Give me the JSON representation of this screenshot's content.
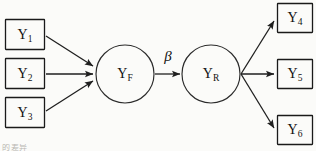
{
  "diagram": {
    "type": "path-diagram",
    "background_color": "#fbfbf9",
    "line_color": "#1f1f1f",
    "indicator_nodes_left": [
      {
        "id": "Y1",
        "base": "Y",
        "subscript": "1",
        "shape": "rectangle",
        "x": 5,
        "y": 19,
        "w": 40,
        "h": 31
      },
      {
        "id": "Y2",
        "base": "Y",
        "subscript": "2",
        "shape": "rectangle",
        "x": 5,
        "y": 58,
        "w": 40,
        "h": 31
      },
      {
        "id": "Y3",
        "base": "Y",
        "subscript": "3",
        "shape": "rectangle",
        "x": 5,
        "y": 97,
        "w": 40,
        "h": 31
      }
    ],
    "latent_nodes": [
      {
        "id": "YF",
        "base": "Y",
        "subscript": "F",
        "shape": "circle",
        "cx": 125,
        "cy": 74,
        "r": 29
      },
      {
        "id": "YR",
        "base": "Y",
        "subscript": "R",
        "shape": "circle",
        "cx": 211,
        "cy": 74,
        "r": 29
      }
    ],
    "indicator_nodes_right": [
      {
        "id": "Y4",
        "base": "Y",
        "subscript": "4",
        "shape": "rectangle",
        "x": 277,
        "y": 3,
        "w": 36,
        "h": 30
      },
      {
        "id": "Y5",
        "base": "Y",
        "subscript": "5",
        "shape": "rectangle",
        "x": 277,
        "y": 59,
        "w": 36,
        "h": 30
      },
      {
        "id": "Y6",
        "base": "Y",
        "subscript": "6",
        "shape": "rectangle",
        "x": 277,
        "y": 115,
        "w": 36,
        "h": 30
      }
    ],
    "edges": [
      {
        "from": "Y1",
        "to": "YF",
        "x1": 46,
        "y1": 36,
        "x2": 95,
        "y2": 67
      },
      {
        "from": "Y2",
        "to": "YF",
        "x1": 46,
        "y1": 74,
        "x2": 95,
        "y2": 74
      },
      {
        "from": "Y3",
        "to": "YF",
        "x1": 46,
        "y1": 111,
        "x2": 95,
        "y2": 81
      },
      {
        "from": "YF",
        "to": "YR",
        "x1": 155,
        "y1": 74,
        "x2": 181,
        "y2": 74,
        "label": "β"
      },
      {
        "from": "YR",
        "to": "Y4",
        "x1": 241,
        "y1": 74,
        "x2": 276,
        "y2": 19
      },
      {
        "from": "YR",
        "to": "Y5",
        "x1": 241,
        "y1": 74,
        "x2": 276,
        "y2": 74
      },
      {
        "from": "YR",
        "to": "Y6",
        "x1": 241,
        "y1": 74,
        "x2": 276,
        "y2": 130
      }
    ],
    "parameter_label": "β",
    "parameter_label_x": 168,
    "parameter_label_y": 57,
    "footer_artifact": "的差异"
  }
}
